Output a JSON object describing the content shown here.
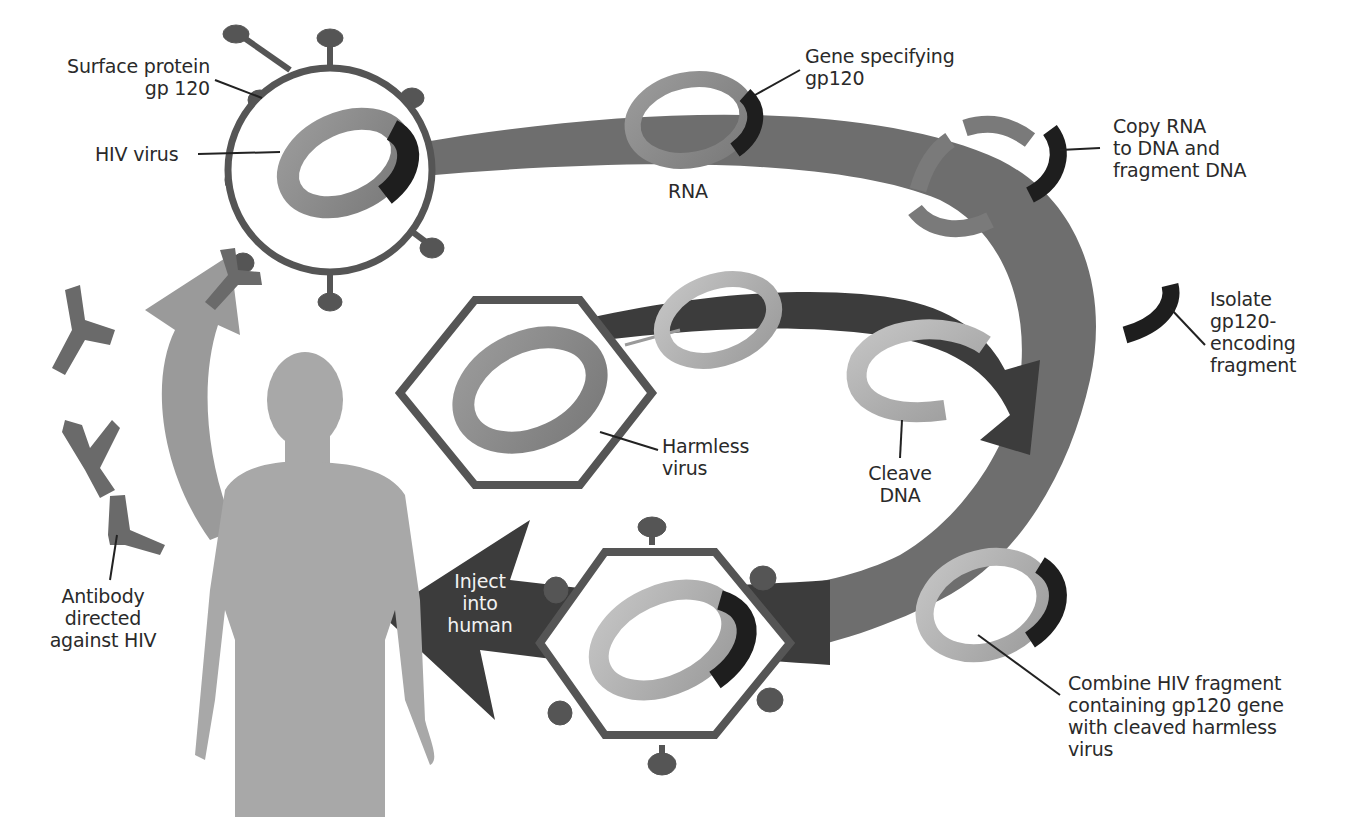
{
  "diagram": {
    "colors": {
      "background": "#ffffff",
      "cycle_band": "#6e6e6e",
      "dark_arrow": "#3c3c3c",
      "light_arrow": "#9a9a9a",
      "ring_gray": "#8a8a8a",
      "ring_light": "#b0b0b0",
      "gene_black": "#1e1e1e",
      "virus_outline": "#555555",
      "human": "#a8a8a8",
      "antibody": "#6a6a6a",
      "text": "#2a2a2a"
    },
    "labels": {
      "surface_protein": "Surface protein\ngp 120",
      "hiv_virus": "HIV virus",
      "gene_specifying": "Gene specifying\n gp120",
      "rna": "RNA",
      "copy_rna": "Copy RNA\nto DNA and\nfragment DNA",
      "isolate": "Isolate\ngp120-\nencoding\nfragment",
      "harmless_virus": "Harmless\nvirus",
      "cleave_dna": "Cleave\nDNA",
      "combine": "Combine HIV fragment\ncontaining gp120 gene\nwith cleaved harmless\nvirus",
      "inject": "Inject\ninto\nhuman",
      "antibody": "Antibody\ndirected\nagainst HIV"
    },
    "steps": [
      {
        "order": 1,
        "label": "HIV virus",
        "note": "Surface protein gp 120"
      },
      {
        "order": 2,
        "label": "RNA",
        "note": "Gene specifying gp120"
      },
      {
        "order": 3,
        "label": "Copy RNA to DNA and fragment DNA"
      },
      {
        "order": 4,
        "label": "Isolate gp120-encoding fragment"
      },
      {
        "order": 5,
        "label": "Harmless virus"
      },
      {
        "order": 6,
        "label": "Cleave DNA"
      },
      {
        "order": 7,
        "label": "Combine HIV fragment containing gp120 gene with cleaved harmless virus"
      },
      {
        "order": 8,
        "label": "Inject into human"
      },
      {
        "order": 9,
        "label": "Antibody directed against HIV"
      }
    ]
  }
}
